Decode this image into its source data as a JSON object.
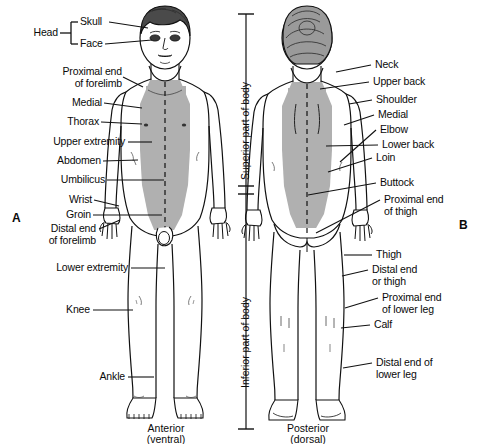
{
  "figure": {
    "panel_a_letter": "A",
    "panel_b_letter": "B",
    "caption_a_line1": "Anterior",
    "caption_a_line2": "(ventral)",
    "caption_b_line1": "Posterior",
    "caption_b_line2": "(dorsal)"
  },
  "colors": {
    "outline": "#111111",
    "shading": "#b0b0b0",
    "hair": "#4a4a4a",
    "text": "#0a0a0a",
    "background": "#ffffff"
  },
  "axis": {
    "superior_label": "Superior part of body",
    "inferior_label": "Inferior part of body"
  },
  "bracket": {
    "head_label": "Head"
  },
  "anterior_labels": [
    {
      "id": "skull",
      "text": "Skull"
    },
    {
      "id": "face",
      "text": "Face"
    },
    {
      "id": "proximal-end-of-forelimb",
      "text": "Proximal end\nof forelimb"
    },
    {
      "id": "medial",
      "text": "Medial"
    },
    {
      "id": "thorax",
      "text": "Thorax"
    },
    {
      "id": "upper-extremity",
      "text": "Upper extremity"
    },
    {
      "id": "abdomen",
      "text": "Abdomen"
    },
    {
      "id": "umbilicus",
      "text": "Umbilicus"
    },
    {
      "id": "wrist",
      "text": "Wrist"
    },
    {
      "id": "groin",
      "text": "Groin"
    },
    {
      "id": "distal-end-of-forelimb",
      "text": "Distal end\nof forelimb"
    },
    {
      "id": "lower-extremity",
      "text": "Lower extremity"
    },
    {
      "id": "knee",
      "text": "Knee"
    },
    {
      "id": "ankle",
      "text": "Ankle"
    }
  ],
  "posterior_labels": [
    {
      "id": "neck",
      "text": "Neck"
    },
    {
      "id": "upper-back",
      "text": "Upper back"
    },
    {
      "id": "shoulder",
      "text": "Shoulder"
    },
    {
      "id": "medial",
      "text": "Medial"
    },
    {
      "id": "elbow",
      "text": "Elbow"
    },
    {
      "id": "lower-back",
      "text": "Lower back"
    },
    {
      "id": "loin",
      "text": "Loin"
    },
    {
      "id": "buttock",
      "text": "Buttock"
    },
    {
      "id": "proximal-end-of-thigh",
      "text": "Proximal end\nof thigh"
    },
    {
      "id": "thigh",
      "text": "Thigh"
    },
    {
      "id": "distal-end-or-thigh",
      "text": "Distal end\nor thigh"
    },
    {
      "id": "proximal-end-of-lower-leg",
      "text": "Proximal end\nof lower leg"
    },
    {
      "id": "calf",
      "text": "Calf"
    },
    {
      "id": "distal-end-of-lower-leg",
      "text": "Distal end of\nlower leg"
    }
  ]
}
